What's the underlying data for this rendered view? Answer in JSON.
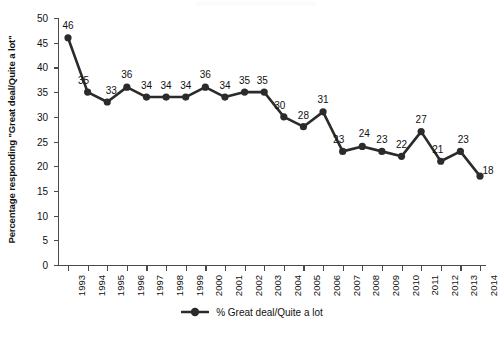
{
  "chart_data": {
    "type": "line",
    "title": "",
    "subtitle": "",
    "xlabel": "",
    "ylabel": "Percentage responding \"Great deal/Quite a lot\"",
    "ylim": [
      0,
      50
    ],
    "ytick_step": 5,
    "yticks": [
      50,
      45,
      40,
      35,
      30,
      25,
      20,
      15,
      10,
      5,
      0
    ],
    "grid": false,
    "legend_position": "bottom-center",
    "categories": [
      "1993",
      "1994",
      "1995",
      "1996",
      "1997",
      "1998",
      "1999",
      "2000",
      "2001",
      "2002",
      "2003",
      "2004",
      "2005",
      "2006",
      "2007",
      "2008",
      "2009",
      "2010",
      "2011",
      "2012",
      "2013",
      "2014"
    ],
    "series": [
      {
        "name": "% Great deal/Quite a lot",
        "color": "#2b2b2b",
        "marker": "circle",
        "values": [
          46,
          35,
          33,
          36,
          34,
          34,
          34,
          36,
          34,
          35,
          35,
          30,
          28,
          31,
          23,
          24,
          23,
          22,
          27,
          21,
          23,
          18
        ]
      }
    ],
    "data_labels": [
      "46",
      "35",
      "33",
      "36",
      "34",
      "34",
      "34",
      "36",
      "34",
      "35",
      "35",
      "30",
      "28",
      "31",
      "23",
      "24",
      "23",
      "22",
      "27",
      "21",
      "23",
      "18"
    ]
  },
  "legend": {
    "entries": [
      {
        "label": "% Great deal/Quite a lot",
        "color": "#2b2b2b"
      }
    ]
  },
  "colors": {
    "series": "#2b2b2b",
    "axis": "#4a4a4a",
    "text": "#111111",
    "background": "#ffffff"
  }
}
